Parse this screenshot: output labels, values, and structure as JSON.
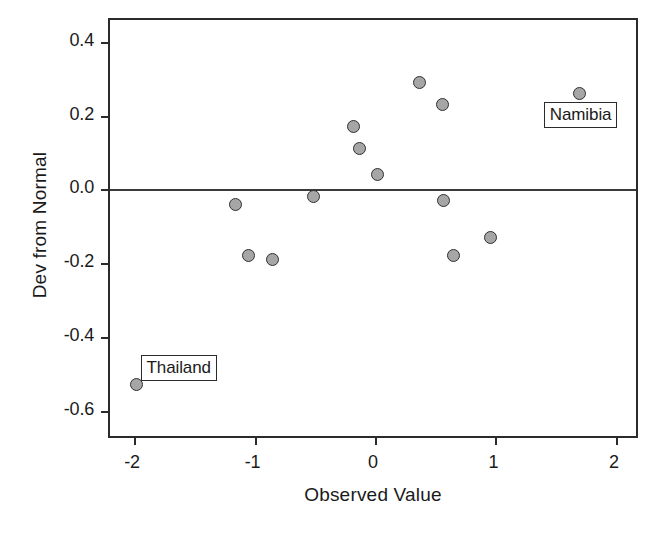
{
  "chart_data": {
    "type": "scatter",
    "title": "",
    "xlabel": "Observed Value",
    "ylabel": "Dev from Normal",
    "xlim": [
      -2.2,
      2.2
    ],
    "ylim": [
      -0.68,
      0.46
    ],
    "xticks": [
      -2,
      -1,
      0,
      1,
      2
    ],
    "xticklabels": [
      "-2",
      "-1",
      "0",
      "1",
      "2"
    ],
    "yticks": [
      0.4,
      0.2,
      0.0,
      -0.2,
      -0.4,
      -0.6
    ],
    "yticklabels": [
      "0.4",
      "0.2",
      "0.0",
      "-0.2",
      "-0.4",
      "-0.6"
    ],
    "grid": false,
    "legend": "none",
    "reference_lines": [
      {
        "axis": "y",
        "value": 0.0
      }
    ],
    "marker": {
      "shape": "circle",
      "fill": "#a6a6a6",
      "edge": "#303030",
      "size_px": 13
    },
    "points": [
      {
        "x": -1.98,
        "y": -0.53,
        "label": "Thailand"
      },
      {
        "x": -1.16,
        "y": -0.04,
        "label": ""
      },
      {
        "x": -1.05,
        "y": -0.18,
        "label": ""
      },
      {
        "x": -0.85,
        "y": -0.19,
        "label": ""
      },
      {
        "x": -0.51,
        "y": -0.02,
        "label": ""
      },
      {
        "x": -0.18,
        "y": 0.17,
        "label": ""
      },
      {
        "x": -0.13,
        "y": 0.11,
        "label": ""
      },
      {
        "x": 0.02,
        "y": 0.04,
        "label": ""
      },
      {
        "x": 0.37,
        "y": 0.29,
        "label": ""
      },
      {
        "x": 0.56,
        "y": 0.23,
        "label": ""
      },
      {
        "x": 0.57,
        "y": -0.03,
        "label": ""
      },
      {
        "x": 0.65,
        "y": -0.18,
        "label": ""
      },
      {
        "x": 0.96,
        "y": -0.13,
        "label": ""
      },
      {
        "x": 1.7,
        "y": 0.26,
        "label": "Namibia"
      }
    ],
    "annotations": [
      {
        "text": "Namibia",
        "point_x": 1.7,
        "point_y": 0.26
      },
      {
        "text": "Thailand",
        "point_x": -1.98,
        "point_y": -0.53
      }
    ]
  },
  "colors": {
    "axis": "#2b2b2b",
    "marker_fill": "#a6a6a6",
    "marker_edge": "#303030",
    "background": "#ffffff",
    "zero_line": "#3a3a3a"
  }
}
